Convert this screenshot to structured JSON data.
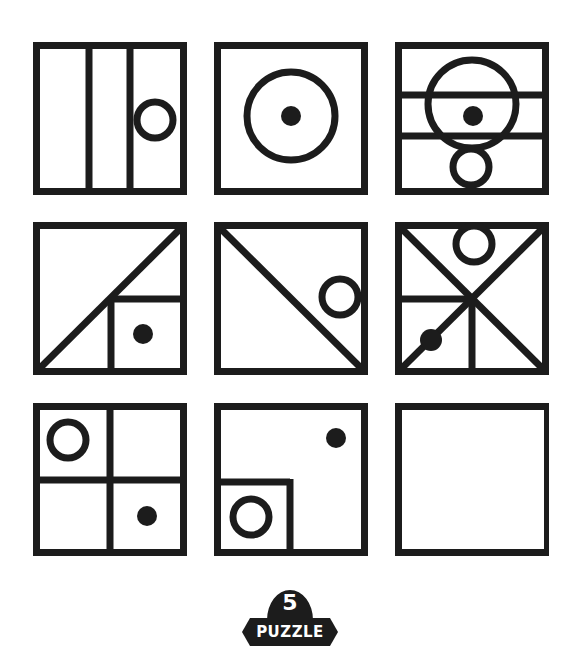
{
  "puzzle": {
    "number": "5",
    "label": "PUZZLE",
    "stroke_color": "#1c1c1c",
    "background": "#ffffff",
    "grid": {
      "rows": 3,
      "cols": 3,
      "cells": [
        {
          "row": 1,
          "col": 1,
          "description": "Square split into three vertical columns; hollow circle in right column"
        },
        {
          "row": 1,
          "col": 2,
          "description": "Large hollow circle centered with a solid dot in center"
        },
        {
          "row": 1,
          "col": 3,
          "description": "Square with two horizontal lines; large hollow circle with solid dot, small hollow circle below touching bottom"
        },
        {
          "row": 2,
          "col": 1,
          "description": "Diagonal from bottom-left to top-right; small square in bottom-right with solid dot"
        },
        {
          "row": 2,
          "col": 2,
          "description": "Diagonal from top-left to bottom-right; hollow circle at right edge"
        },
        {
          "row": 2,
          "col": 3,
          "description": "Both diagonals; hollow circle at top; horizontal and vertical half-lines in lower area; solid dot on lower-left diagonal"
        },
        {
          "row": 3,
          "col": 1,
          "description": "Square divided into four quadrants; hollow circle top-left, solid dot bottom-right"
        },
        {
          "row": 3,
          "col": 2,
          "description": "Small square in bottom-left containing hollow circle; solid dot top-right"
        },
        {
          "row": 3,
          "col": 3,
          "description": "Empty square (answer missing)"
        }
      ]
    }
  }
}
